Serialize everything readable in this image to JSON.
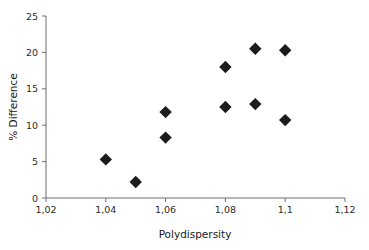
{
  "chart_data": {
    "type": "scatter",
    "title": "",
    "xlabel": "Polydispersity",
    "ylabel": "% Difference",
    "xlim": [
      1.02,
      1.12
    ],
    "ylim": [
      0,
      25
    ],
    "grid": false,
    "legend": false,
    "x_tick_labels": [
      "1,02",
      "1,04",
      "1,06",
      "1,08",
      "1,1",
      "1,12"
    ],
    "x_tick_values": [
      1.02,
      1.04,
      1.06,
      1.08,
      1.1,
      1.12
    ],
    "y_tick_labels": [
      "0",
      "5",
      "10",
      "15",
      "20",
      "25"
    ],
    "y_tick_values": [
      0,
      5,
      10,
      15,
      20,
      25
    ],
    "marker": "diamond",
    "marker_color": "#1c1c1c",
    "series": [
      {
        "name": "",
        "points": [
          {
            "x": 1.04,
            "y": 5.3
          },
          {
            "x": 1.05,
            "y": 2.2
          },
          {
            "x": 1.06,
            "y": 11.8
          },
          {
            "x": 1.06,
            "y": 8.3
          },
          {
            "x": 1.08,
            "y": 18.0
          },
          {
            "x": 1.08,
            "y": 12.5
          },
          {
            "x": 1.09,
            "y": 20.5
          },
          {
            "x": 1.09,
            "y": 12.9
          },
          {
            "x": 1.1,
            "y": 20.3
          },
          {
            "x": 1.1,
            "y": 10.7
          }
        ]
      }
    ]
  },
  "axes": {
    "x_title": "Polydispersity",
    "y_title": "% Difference",
    "x_ticks": [
      "1,02",
      "1,04",
      "1,06",
      "1,08",
      "1,1",
      "1,12"
    ],
    "y_ticks": [
      "0",
      "5",
      "10",
      "15",
      "20",
      "25"
    ]
  },
  "colors": {
    "marker": "#1c1c1c",
    "axis": "#6e6e6e",
    "text": "#1a1a1a",
    "background": "#ffffff"
  }
}
